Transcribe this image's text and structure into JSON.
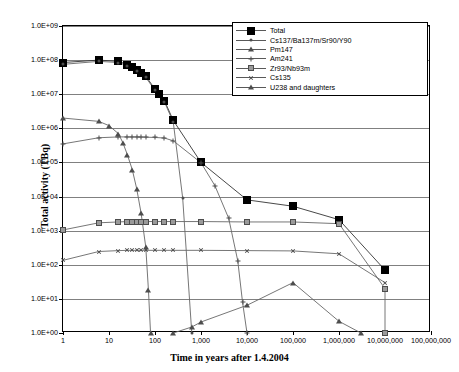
{
  "chart_data": {
    "type": "line",
    "title": "",
    "xlabel": "Time in years after 1.4.2004",
    "ylabel": "Total activity (TBq)",
    "xscale": "log",
    "yscale": "log",
    "xlim": [
      1,
      100000000
    ],
    "ylim": [
      1,
      1000000000
    ],
    "grid": true,
    "legend_position": "top-right",
    "x_tick_labels": [
      "1",
      "10",
      "100",
      "1,000",
      "10,000",
      "100,000",
      "1,000,000",
      "10,000,000",
      "100,000,000"
    ],
    "x_tick_values": [
      1,
      10,
      100,
      1000,
      10000,
      100000,
      1000000,
      10000000,
      100000000
    ],
    "y_tick_labels": [
      "1.0E+00",
      "1.0E+01",
      "1.0E+02",
      "1.0E+03",
      "1.0E+04",
      "1.0E+05",
      "1.0E+06",
      "1.0E+07",
      "1.0E+08",
      "1.0E+09"
    ],
    "y_tick_values": [
      1,
      10,
      100,
      1000,
      10000,
      100000,
      1000000,
      10000000,
      100000000,
      1000000000
    ],
    "series": [
      {
        "name": "Total",
        "marker": "square-large",
        "color": "#000000",
        "points": [
          [
            1,
            85000000
          ],
          [
            6,
            100000000
          ],
          [
            16,
            92000000
          ],
          [
            25,
            74000000
          ],
          [
            32,
            62000000
          ],
          [
            40,
            52000000
          ],
          [
            50,
            42000000
          ],
          [
            63,
            34000000
          ],
          [
            100,
            14000000
          ],
          [
            125,
            10000000
          ],
          [
            160,
            6500000
          ],
          [
            250,
            1700000
          ],
          [
            1000,
            100000
          ],
          [
            10000,
            8000
          ],
          [
            100000,
            5200
          ],
          [
            1000000,
            2100
          ],
          [
            10000000,
            70
          ]
        ]
      },
      {
        "name": "Cs137/Ba137m/Sr90/Y90",
        "marker": "dot",
        "color": "#4d4d4d",
        "points": [
          [
            1,
            75000000
          ],
          [
            6,
            92000000
          ],
          [
            16,
            85000000
          ],
          [
            25,
            68000000
          ],
          [
            40,
            48000000
          ],
          [
            63,
            31000000
          ],
          [
            100,
            13000000
          ],
          [
            160,
            6000000
          ],
          [
            250,
            1500000
          ],
          [
            400,
            9000
          ],
          [
            630,
            1.0
          ]
        ]
      },
      {
        "name": "Pm147",
        "marker": "triangle",
        "color": "#4d4d4d",
        "points": [
          [
            1,
            2000000
          ],
          [
            6,
            1600000
          ],
          [
            10,
            1200000
          ],
          [
            16,
            700000
          ],
          [
            20,
            380000
          ],
          [
            25,
            170000
          ],
          [
            32,
            62000
          ],
          [
            40,
            17000
          ],
          [
            50,
            3200
          ],
          [
            63,
            330
          ],
          [
            72,
            18
          ],
          [
            80,
            1.0
          ]
        ]
      },
      {
        "name": "Am241",
        "marker": "plus",
        "color": "#4d4d4d",
        "points": [
          [
            1,
            350000
          ],
          [
            6,
            530000
          ],
          [
            16,
            560000
          ],
          [
            25,
            560000
          ],
          [
            32,
            560000
          ],
          [
            40,
            560000
          ],
          [
            50,
            555000
          ],
          [
            63,
            550000
          ],
          [
            100,
            540000
          ],
          [
            160,
            520000
          ],
          [
            250,
            430000
          ],
          [
            1000,
            98000
          ],
          [
            2000,
            21000
          ],
          [
            4000,
            2300
          ],
          [
            6300,
            130
          ],
          [
            8000,
            8
          ],
          [
            10000,
            1.0
          ]
        ]
      },
      {
        "name": "Zr93/Nb93m",
        "marker": "square-gray",
        "color": "#9a9a9a",
        "points": [
          [
            1,
            1050
          ],
          [
            6,
            1700
          ],
          [
            16,
            1800
          ],
          [
            25,
            1850
          ],
          [
            32,
            1850
          ],
          [
            40,
            1850
          ],
          [
            50,
            1850
          ],
          [
            63,
            1850
          ],
          [
            100,
            1850
          ],
          [
            160,
            1850
          ],
          [
            250,
            1850
          ],
          [
            1000,
            1850
          ],
          [
            10000,
            1800
          ],
          [
            100000,
            1800
          ],
          [
            1000000,
            1600
          ],
          [
            10000000,
            20
          ],
          [
            10000000,
            1.0
          ]
        ]
      },
      {
        "name": "Cs135",
        "marker": "x",
        "color": "#4d4d4d",
        "points": [
          [
            1,
            135
          ],
          [
            6,
            245
          ],
          [
            16,
            260
          ],
          [
            25,
            265
          ],
          [
            32,
            265
          ],
          [
            40,
            265
          ],
          [
            50,
            265
          ],
          [
            63,
            265
          ],
          [
            100,
            265
          ],
          [
            160,
            265
          ],
          [
            250,
            265
          ],
          [
            1000,
            265
          ],
          [
            10000,
            260
          ],
          [
            100000,
            255
          ],
          [
            1000000,
            210
          ],
          [
            10000000,
            30
          ]
        ]
      },
      {
        "name": "U238 and daughters",
        "marker": "triangle",
        "color": "#4d4d4d",
        "points": [
          [
            250,
            1.0
          ],
          [
            630,
            1.5
          ],
          [
            1000,
            2.1
          ],
          [
            10000,
            6.5
          ],
          [
            100000,
            30
          ],
          [
            1000000,
            2.2
          ],
          [
            3000000,
            1.0
          ]
        ]
      }
    ]
  },
  "legend": {
    "entries": [
      {
        "label": "Total",
        "marker": "square-large"
      },
      {
        "label": "Cs137/Ba137m/Sr90/Y90",
        "marker": "dot"
      },
      {
        "label": "Pm147",
        "marker": "triangle"
      },
      {
        "label": "Am241",
        "marker": "plus"
      },
      {
        "label": "Zr93/Nb93m",
        "marker": "square-gray"
      },
      {
        "label": "Cs135",
        "marker": "x"
      },
      {
        "label": "U238 and daughters",
        "marker": "triangle"
      }
    ]
  }
}
